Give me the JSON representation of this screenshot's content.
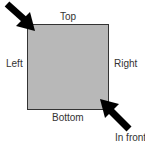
{
  "diagram": {
    "labels": {
      "top": "Top",
      "left": "Left",
      "right": "Right",
      "bottom": "Bottom",
      "in_front": "In front"
    },
    "colors": {
      "square_fill": "#b8b8b8",
      "square_border": "#333333",
      "arrow": "#000000",
      "text": "#333333"
    },
    "icons": [
      "arrow-down-right-icon",
      "arrow-up-left-icon"
    ]
  }
}
